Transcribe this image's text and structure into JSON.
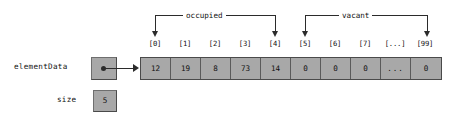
{
  "diagram": {
    "fields": [
      {
        "name": "elementData-field",
        "label": "elementData",
        "kind": "reference"
      },
      {
        "name": "size-field",
        "label": "size",
        "value": "5",
        "kind": "int"
      }
    ],
    "pointer": {
      "label": "elementData",
      "icon": "reference-dot-icon",
      "arrow": "arrow-right-icon",
      "target": "array"
    },
    "array": {
      "capacity": 100,
      "shown_cells": 10,
      "indices": [
        "[0]",
        "[1]",
        "[2]",
        "[3]",
        "[4]",
        "[5]",
        "[6]",
        "[7]",
        "[...]",
        "[99]"
      ],
      "values": [
        "12",
        "19",
        "8",
        "73",
        "14",
        "0",
        "0",
        "0",
        "...",
        "0"
      ],
      "ellipsis_cell_index": 8
    },
    "spans": [
      {
        "name": "occupied-span",
        "caption": "occupied",
        "from_index": "[0]",
        "to_index": "[4]",
        "arrow_icon": "arrow-down-icon"
      },
      {
        "name": "vacant-span",
        "caption": "vacant",
        "from_index": "[5]",
        "to_index": "[99]",
        "arrow_icon": "arrow-down-icon"
      }
    ],
    "colors": {
      "cell_fill": "#a8a8a8",
      "cell_border": "#4a4a4a",
      "line": "#2b2b2b",
      "text": "#111111",
      "background": "#ffffff"
    }
  },
  "chart_data": {
    "type": "table",
    "categories": [
      "[0]",
      "[1]",
      "[2]",
      "[3]",
      "[4]",
      "[5]",
      "[6]",
      "[7]",
      "[...]",
      "[99]"
    ],
    "values": [
      "12",
      "19",
      "8",
      "73",
      "14",
      "0",
      "0",
      "0",
      "...",
      "0"
    ],
    "annotations": [
      "occupied",
      "vacant"
    ],
    "xlabel": "index",
    "ylabel": "element value"
  }
}
